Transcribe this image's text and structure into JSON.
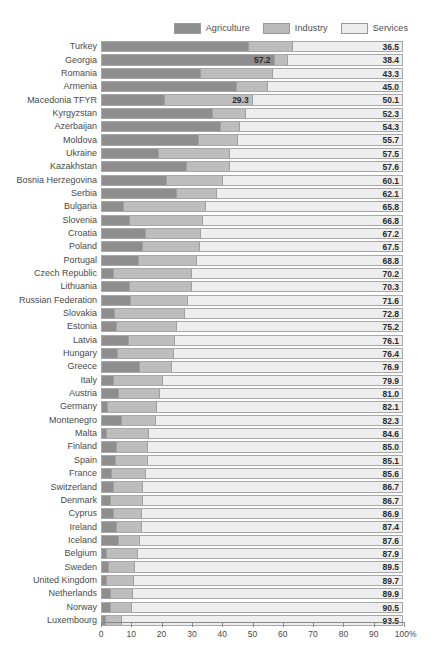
{
  "legend": {
    "items": [
      {
        "label": "Agriculture",
        "key": "agriculture",
        "color": "#8e8e8e",
        "icon": "legend-swatch-icon"
      },
      {
        "label": "Industry",
        "key": "industry",
        "color": "#bdbdbd",
        "icon": "legend-swatch-icon"
      },
      {
        "label": "Services",
        "key": "services",
        "color": "#eeeeee",
        "icon": "legend-swatch-icon"
      }
    ]
  },
  "axis": {
    "ticks": [
      "0",
      "10",
      "20",
      "30",
      "40",
      "50",
      "60",
      "70",
      "80",
      "90",
      "100%"
    ],
    "min": 0,
    "max": 100
  },
  "chart_data": {
    "type": "bar",
    "orientation": "horizontal",
    "stacked": true,
    "title": "",
    "subtitle": "",
    "xlabel": "",
    "ylabel": "",
    "xlim": [
      0,
      100
    ],
    "grid": false,
    "legend_position": "top-right",
    "value_labels": "services share shown at right of each bar; largest non-services segment labelled inline where it dominates",
    "categories": [
      "Turkey",
      "Georgia",
      "Romania",
      "Armenia",
      "Macedonia TFYR",
      "Kyrgyzstan",
      "Azerbaijan",
      "Moldova",
      "Ukraine",
      "Kazakhstan",
      "Bosnia Herzegovina",
      "Serbia",
      "Bulgaria",
      "Slovenia",
      "Croatia",
      "Poland",
      "Portugal",
      "Czech Republic",
      "Lithuania",
      "Russian Federation",
      "Slovakia",
      "Estonia",
      "Latvia",
      "Hungary",
      "Greece",
      "Italy",
      "Austria",
      "Germany",
      "Montenegro",
      "Malta",
      "Finland",
      "Spain",
      "France",
      "Switzerland",
      "Denmark",
      "Cyprus",
      "Ireland",
      "Iceland",
      "Belgium",
      "Sweden",
      "United Kingdom",
      "Netherlands",
      "Norway",
      "Luxembourg"
    ],
    "series": [
      {
        "name": "Agriculture",
        "color": "#8e8e8e",
        "values": [
          48.7,
          57.2,
          32.7,
          44.7,
          20.6,
          36.5,
          39.3,
          32.5,
          18.8,
          28.0,
          21.2,
          24.5,
          7.0,
          9.1,
          14.3,
          13.3,
          11.9,
          3.6,
          9.1,
          9.3,
          3.9,
          4.6,
          8.8,
          5.0,
          12.4,
          3.8,
          5.2,
          1.6,
          6.3,
          1.3,
          4.5,
          4.2,
          2.9,
          3.6,
          2.5,
          3.8,
          4.7,
          5.4,
          1.3,
          2.0,
          1.2,
          2.6,
          2.5,
          1.1
        ]
      },
      {
        "name": "Industry",
        "color": "#bdbdbd",
        "values": [
          14.8,
          4.4,
          24.0,
          10.3,
          29.3,
          11.2,
          6.4,
          13.2,
          23.7,
          14.4,
          18.7,
          13.4,
          27.2,
          24.1,
          18.5,
          19.2,
          19.3,
          26.2,
          20.6,
          19.1,
          23.3,
          20.2,
          15.1,
          18.6,
          10.7,
          16.3,
          13.8,
          16.3,
          11.4,
          14.1,
          10.5,
          10.7,
          11.5,
          9.7,
          10.8,
          9.3,
          8.2,
          7.0,
          10.2,
          8.5,
          9.1,
          7.5,
          7.0,
          5.4
        ]
      },
      {
        "name": "Services",
        "color": "#eeeeee",
        "values": [
          36.5,
          38.4,
          43.3,
          45.0,
          50.1,
          52.3,
          54.3,
          55.7,
          57.5,
          57.6,
          60.1,
          62.1,
          65.8,
          66.8,
          67.2,
          67.5,
          68.8,
          70.2,
          70.3,
          71.6,
          72.8,
          75.2,
          76.1,
          76.4,
          76.9,
          79.9,
          81.0,
          82.1,
          82.3,
          84.6,
          85.0,
          85.1,
          85.6,
          86.7,
          86.7,
          86.9,
          87.4,
          87.6,
          87.9,
          89.5,
          89.7,
          89.9,
          90.5,
          93.5
        ]
      }
    ],
    "inline_labels": [
      {
        "category": "Georgia",
        "series": "Agriculture",
        "value": "57.2"
      },
      {
        "category": "Macedonia TFYR",
        "series": "Industry",
        "value": "29.3"
      }
    ],
    "services_labels": [
      "36.5",
      "38.4",
      "43.3",
      "45.0",
      "50.1",
      "52.3",
      "54.3",
      "55.7",
      "57.5",
      "57.6",
      "60.1",
      "62.1",
      "65.8",
      "66.8",
      "67.2",
      "67.5",
      "68.8",
      "70.2",
      "70.3",
      "71.6",
      "72.8",
      "75.2",
      "76.1",
      "76.4",
      "76.9",
      "79.9",
      "81.0",
      "82.1",
      "82.3",
      "84.6",
      "85.0",
      "85.1",
      "85.6",
      "86.7",
      "86.7",
      "86.9",
      "87.4",
      "87.6",
      "87.9",
      "89.5",
      "89.7",
      "89.9",
      "90.5",
      "93.5"
    ]
  }
}
